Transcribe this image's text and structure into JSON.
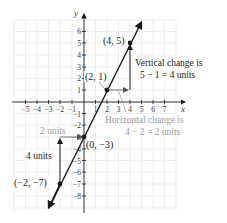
{
  "graph": {
    "x_axis_label": "x",
    "y_axis_label": "y",
    "x_ticks": [
      "−5",
      "−4",
      "−3",
      "−2",
      "−1",
      "1",
      "2",
      "3",
      "4",
      "5",
      "6",
      "7"
    ],
    "y_ticks": [
      "6",
      "5",
      "4",
      "3",
      "2",
      "1",
      "−1",
      "−2",
      "−3",
      "−4",
      "−5",
      "−6",
      "−7",
      "−8"
    ]
  },
  "points": [
    {
      "label": "(4, 5)",
      "x": 4,
      "y": 5
    },
    {
      "label": "(2, 1)",
      "x": 2,
      "y": 1
    },
    {
      "label": "(0, −3)",
      "x": 0,
      "y": -3
    },
    {
      "label": "(−2, −7)",
      "x": -2,
      "y": -7
    }
  ],
  "annotations": {
    "vertical_change_line1": "Vertical change is",
    "vertical_change_line2": "5 − 1 = 4 units",
    "horizontal_change_line1": "Horizontal change is",
    "horizontal_change_line2": "4 − 2 = 2 units",
    "two_units": "2 units",
    "four_units": "4 units"
  },
  "colors": {
    "line": "#1a1a1a",
    "grid": "#e6e6e6",
    "gray_text": "#9a9a9a"
  }
}
